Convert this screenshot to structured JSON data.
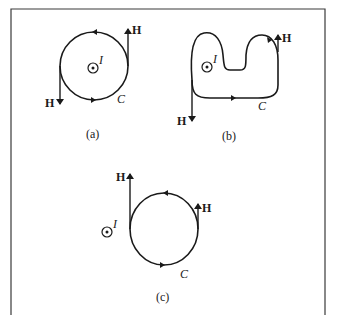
{
  "figure": {
    "panels": [
      {
        "id": "a",
        "caption": "(a)",
        "contour_label": "C",
        "current_label": "I",
        "field_labels": [
          "H",
          "H"
        ],
        "contour_shape": "circle",
        "current_inside_contour": true
      },
      {
        "id": "b",
        "caption": "(b)",
        "contour_label": "C",
        "current_label": "I",
        "field_labels": [
          "H",
          "H"
        ],
        "contour_shape": "irregular",
        "current_inside_contour": true
      },
      {
        "id": "c",
        "caption": "(c)",
        "contour_label": "C",
        "current_label": "I",
        "field_labels": [
          "H",
          "H"
        ],
        "contour_shape": "circle",
        "current_inside_contour": false
      }
    ]
  },
  "colors": {
    "stroke": "#1a1a1a",
    "frame": "#3a3a3a",
    "background": "#ffffff"
  }
}
